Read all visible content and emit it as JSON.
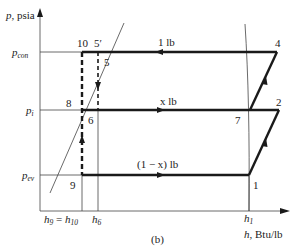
{
  "figure": {
    "caption": "(b)",
    "y_axis_label": "p, psia",
    "x_axis_label": "h, Btu/lb"
  },
  "pressure_levels": [
    {
      "id": "p_con",
      "label_main": "p",
      "label_sub": "con"
    },
    {
      "id": "p_i",
      "label_main": "p",
      "label_sub": "i"
    },
    {
      "id": "p_ev",
      "label_main": "p",
      "label_sub": "ev"
    }
  ],
  "enthalpy_ticks": [
    {
      "id": "h9_h10",
      "text": "h₉ = h₁₀"
    },
    {
      "id": "h6",
      "text": "h₆"
    },
    {
      "id": "h1",
      "text": "h₁"
    }
  ],
  "state_points": [
    {
      "id": "1",
      "label": "1"
    },
    {
      "id": "2",
      "label": "2"
    },
    {
      "id": "4",
      "label": "4"
    },
    {
      "id": "5",
      "label": "5"
    },
    {
      "id": "5p",
      "label": "5′"
    },
    {
      "id": "6",
      "label": "6"
    },
    {
      "id": "7",
      "label": "7"
    },
    {
      "id": "8",
      "label": "8"
    },
    {
      "id": "9",
      "label": "9"
    },
    {
      "id": "10",
      "label": "10"
    }
  ],
  "flow_labels": {
    "condenser": "1 lb",
    "intermediate": "x lb",
    "evaporator": "(1 − x) lb"
  }
}
